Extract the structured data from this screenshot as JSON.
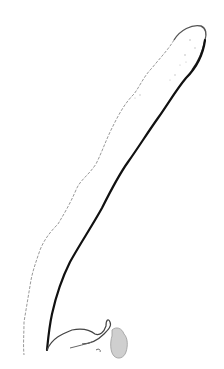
{
  "image": {
    "subject": "line sketch of an elongated specimen",
    "background": "#ffffff",
    "stroke_dark": "#111111",
    "stroke_light": "#9a9a9a",
    "fill_speckle": "#c8c8c8"
  }
}
